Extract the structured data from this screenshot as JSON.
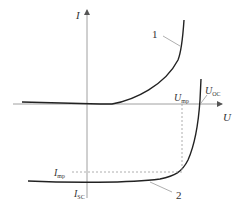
{
  "diagram": {
    "type": "I-U characteristic",
    "axes": {
      "x_label": "U",
      "y_label": "I"
    },
    "curves": [
      {
        "id": "1",
        "label": "1",
        "description": "dark I-U curve (diode-like, rising in first quadrant)"
      },
      {
        "id": "2",
        "label": "2",
        "description": "illuminated I-U curve (shifted down, crossing U axis at U_OC)"
      }
    ],
    "annotations": {
      "u_mp": {
        "main": "U",
        "sub": "mp"
      },
      "u_oc": {
        "main": "U",
        "sub": "OC"
      },
      "i_mp": {
        "main": "I",
        "sub": "mp"
      },
      "i_sc": {
        "main": "I",
        "sub": "SC"
      }
    },
    "colors": {
      "axis": "#888888",
      "curve": "#222222",
      "dashed": "#999999",
      "text": "#333333"
    }
  }
}
